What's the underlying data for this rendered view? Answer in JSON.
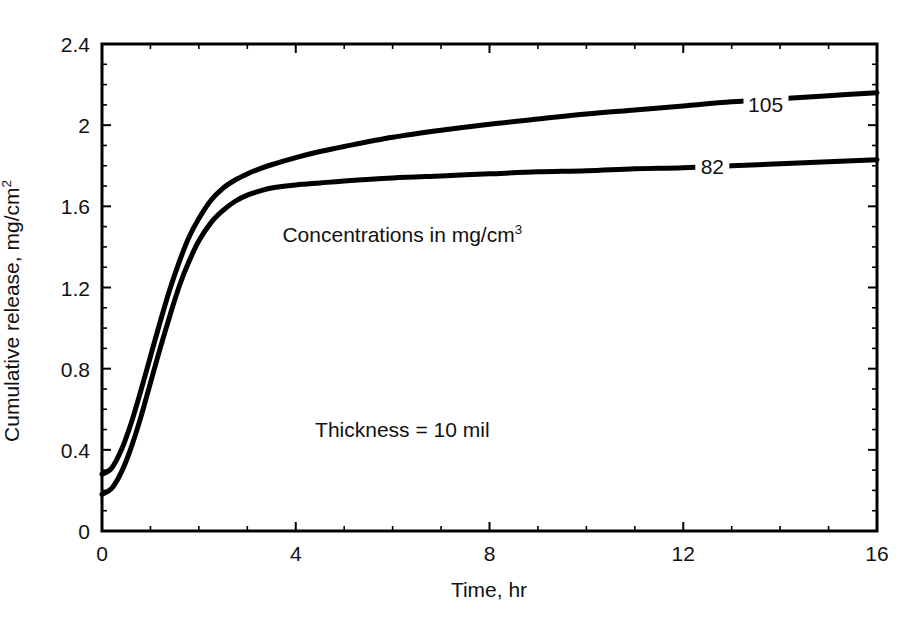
{
  "chart_data": {
    "type": "line",
    "title": "",
    "xlabel": "Time, hr",
    "ylabel_prefix": "Cumulative release, mg/cm",
    "ylabel_sup": "2",
    "xlim": [
      0,
      16
    ],
    "ylim": [
      0,
      2.4
    ],
    "grid": false,
    "legend_position": "inline-curve-labels",
    "xticks": [
      "0",
      "4",
      "8",
      "12",
      "16"
    ],
    "xtick_values": [
      0,
      4,
      8,
      12,
      16
    ],
    "yticks": [
      "0",
      "0.4",
      "0.8",
      "1.2",
      "1.6",
      "2",
      "2.4"
    ],
    "ytick_values": [
      0,
      0.4,
      0.8,
      1.2,
      1.6,
      2,
      2.4
    ],
    "minor_ticks_per_major": {
      "x": 4,
      "y": 4
    },
    "annotations": [
      {
        "name": "concentration-units-note",
        "text_prefix": "Concentrations in mg/cm",
        "text_sup": "3",
        "x": 6.2,
        "y": 1.46
      },
      {
        "name": "thickness-note",
        "text": "Thickness = 10 mil",
        "x": 6.2,
        "y": 0.5
      }
    ],
    "series": [
      {
        "name": "105",
        "label": "105",
        "label_x": 13.7,
        "label_y": 2.105,
        "color": "#000000",
        "x": [
          0,
          0.2,
          0.4,
          0.6,
          0.8,
          1.0,
          1.2,
          1.4,
          1.6,
          1.8,
          2.0,
          2.25,
          2.5,
          2.75,
          3.0,
          3.25,
          3.5,
          4.0,
          4.5,
          5.0,
          6.0,
          7.0,
          8.0,
          9.0,
          10.0,
          11.0,
          12.0,
          13.0,
          14.0,
          15.0,
          16.0
        ],
        "y": [
          0.28,
          0.31,
          0.4,
          0.53,
          0.69,
          0.86,
          1.03,
          1.19,
          1.33,
          1.45,
          1.54,
          1.63,
          1.69,
          1.73,
          1.76,
          1.785,
          1.805,
          1.84,
          1.87,
          1.895,
          1.94,
          1.975,
          2.005,
          2.03,
          2.055,
          2.075,
          2.095,
          2.115,
          2.13,
          2.145,
          2.16
        ]
      },
      {
        "name": "82",
        "label": "82",
        "label_x": 12.6,
        "label_y": 1.8,
        "color": "#000000",
        "x": [
          0,
          0.2,
          0.4,
          0.6,
          0.8,
          1.0,
          1.2,
          1.4,
          1.6,
          1.8,
          2.0,
          2.25,
          2.5,
          2.75,
          3.0,
          3.25,
          3.5,
          4.0,
          4.5,
          5.0,
          6.0,
          7.0,
          8.0,
          9.0,
          10.0,
          11.0,
          12.0,
          13.0,
          14.0,
          15.0,
          16.0
        ],
        "y": [
          0.18,
          0.21,
          0.29,
          0.41,
          0.56,
          0.73,
          0.9,
          1.06,
          1.21,
          1.33,
          1.43,
          1.52,
          1.58,
          1.625,
          1.655,
          1.675,
          1.69,
          1.705,
          1.715,
          1.725,
          1.74,
          1.75,
          1.76,
          1.77,
          1.775,
          1.785,
          1.79,
          1.8,
          1.81,
          1.82,
          1.83
        ]
      }
    ]
  },
  "plot_geometry": {
    "left": 102,
    "right": 877,
    "top": 44,
    "bottom": 531
  },
  "style": {
    "axis_color": "#000000",
    "curve_color": "#000000",
    "background": "#ffffff",
    "axis_width": 3,
    "curve_width": 5
  }
}
